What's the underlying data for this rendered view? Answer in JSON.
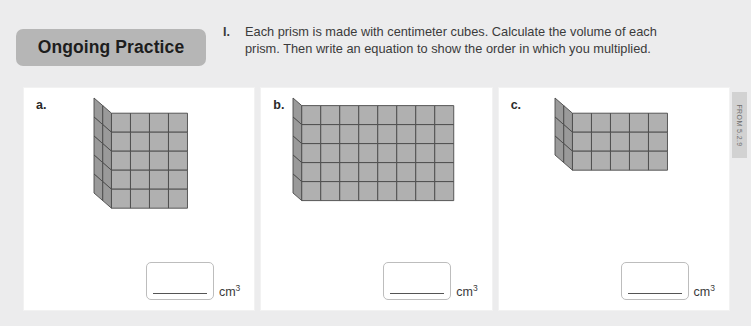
{
  "header": {
    "badge_label": "Ongoing Practice",
    "problem_number": "I.",
    "problem_text": "Each prism is made with centimeter cubes. Calculate the volume of each prism. Then write an equation to show the order in which you multiplied."
  },
  "side_tab": {
    "label": "FROM 5.2.9"
  },
  "unit_label": "cm",
  "unit_exponent": "3",
  "parts": [
    {
      "label": "a.",
      "prism": {
        "width": 4,
        "height": 5,
        "depth": 2
      },
      "answer_value": "",
      "unit": "cm3"
    },
    {
      "label": "b.",
      "prism": {
        "width": 8,
        "height": 5,
        "depth": 1
      },
      "answer_value": "",
      "unit": "cm3"
    },
    {
      "label": "c.",
      "prism": {
        "width": 5,
        "height": 3,
        "depth": 2
      },
      "answer_value": "",
      "unit": "cm3"
    }
  ],
  "colors": {
    "page_background": "#ececed",
    "panel_background": "#ffffff",
    "badge_background": "#b6b6b6",
    "cube_face": "#b0b0b0",
    "cube_top": "#c6c6c6",
    "cube_side": "#9a9a9a",
    "cube_edge": "#4a4a4a",
    "text": "#3b3b3b"
  }
}
